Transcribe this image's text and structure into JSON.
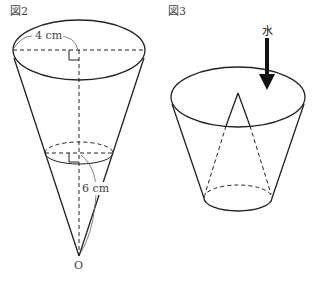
{
  "figure2": {
    "title": "図2",
    "radius_label": "4 cm",
    "height_label": "6 cm",
    "apex_label": "O"
  },
  "figure3": {
    "title": "図3",
    "water_label": "水"
  }
}
